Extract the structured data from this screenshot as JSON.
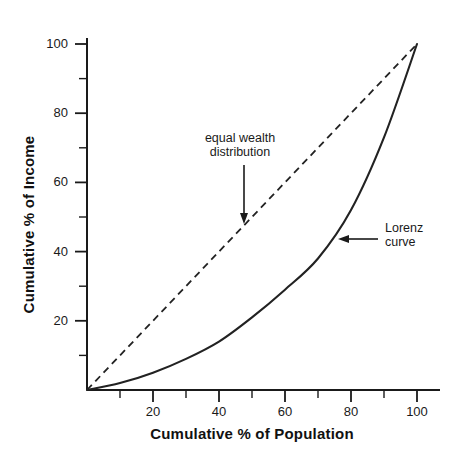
{
  "chart_data": {
    "type": "line",
    "title": "",
    "xlabel": "Cumulative % of Population",
    "ylabel": "Cumulative % of Income",
    "xlim": [
      0,
      100
    ],
    "ylim": [
      0,
      100
    ],
    "grid": false,
    "legend": "none",
    "x_ticks": [
      20,
      40,
      60,
      80,
      100
    ],
    "x_tick_labels": [
      "20",
      "40",
      "60",
      "80",
      "100"
    ],
    "x_minor_ticks": [
      10,
      30,
      50,
      70,
      90
    ],
    "y_ticks": [
      20,
      40,
      60,
      80,
      100
    ],
    "y_tick_labels": [
      "20",
      "40",
      "60",
      "80",
      "100"
    ],
    "y_minor_ticks": [
      10,
      30,
      50,
      70,
      90
    ],
    "series": [
      {
        "name": "equal wealth distribution",
        "style": "dashed",
        "color": "#222222",
        "x": [
          0,
          100
        ],
        "values": [
          0,
          100
        ]
      },
      {
        "name": "Lorenz curve",
        "style": "solid",
        "color": "#222222",
        "x": [
          0,
          10,
          20,
          30,
          40,
          50,
          60,
          70,
          80,
          90,
          100
        ],
        "values": [
          0,
          2,
          5,
          9,
          14,
          21,
          29,
          38,
          52,
          73,
          100
        ]
      }
    ],
    "annotations": [
      {
        "name": "equal-wealth-annotation",
        "text": "equal wealth\ndistribution",
        "arrow": "down",
        "points_to_series": "equal wealth distribution"
      },
      {
        "name": "lorenz-curve-annotation",
        "text": "Lorenz\ncurve",
        "arrow": "left",
        "points_to_series": "Lorenz curve"
      }
    ]
  },
  "axes": {
    "x_title": "Cumulative % of Population",
    "y_title": "Cumulative % of Income"
  },
  "annotations": {
    "equal_wealth": "equal wealth\ndistribution",
    "lorenz": "Lorenz\ncurve"
  },
  "colors": {
    "axis": "#1a1a1a",
    "curve": "#222222",
    "background": "#ffffff"
  }
}
